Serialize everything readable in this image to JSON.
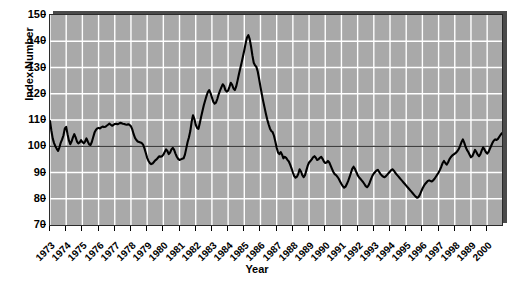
{
  "chart_data": {
    "type": "line",
    "title": "",
    "xlabel": "Year",
    "ylabel": "Index Number",
    "ylim": [
      70,
      150
    ],
    "yticks": [
      70,
      80,
      90,
      100,
      110,
      120,
      130,
      140,
      150
    ],
    "xlim": [
      1973,
      2000.92
    ],
    "grid": true,
    "legend": "none",
    "reference_line": {
      "value": 100,
      "color": "#000000",
      "label": ""
    },
    "xtick_labels": [
      "1973",
      "1974",
      "1975",
      "1976",
      "1977",
      "1978",
      "1979",
      "1980",
      "1981",
      "1982",
      "1983",
      "1984",
      "1985",
      "1986",
      "1987",
      "1988",
      "1989",
      "1990",
      "1991",
      "1992",
      "1993",
      "1994",
      "1995",
      "1996",
      "1997",
      "1998",
      "1989",
      "2000"
    ],
    "series": [
      {
        "name": "Index Number",
        "color": "#000000",
        "x_start": 1973,
        "x_step_months": 1,
        "values": [
          109.6,
          106.0,
          103.0,
          101.2,
          100.0,
          99.0,
          98.2,
          99.6,
          101.4,
          102.6,
          104.2,
          106.8,
          107.4,
          104.6,
          102.2,
          100.8,
          101.8,
          103.4,
          104.6,
          103.4,
          101.8,
          101.1,
          101.5,
          102.3,
          101.6,
          101.1,
          101.8,
          103.0,
          101.8,
          100.7,
          100.5,
          101.6,
          103.4,
          105.2,
          106.2,
          106.8,
          107.0,
          106.8,
          107.2,
          107.5,
          107.3,
          107.4,
          107.8,
          108.2,
          108.6,
          108.2,
          107.8,
          108.1,
          108.5,
          108.6,
          108.4,
          108.6,
          108.9,
          108.8,
          108.6,
          108.5,
          108.3,
          108.2,
          108.4,
          108.1,
          107.6,
          106.4,
          104.6,
          103.2,
          102.4,
          101.8,
          101.6,
          101.4,
          101.2,
          100.6,
          99.2,
          97.4,
          95.6,
          94.4,
          93.6,
          93.2,
          93.4,
          94.0,
          94.6,
          95.0,
          95.6,
          96.2,
          96.0,
          96.2,
          96.8,
          97.8,
          98.8,
          98.2,
          97.0,
          97.6,
          98.8,
          99.4,
          98.6,
          97.2,
          96.0,
          95.2,
          94.8,
          95.0,
          95.2,
          95.4,
          96.8,
          99.2,
          101.6,
          103.4,
          105.8,
          109.4,
          111.8,
          110.4,
          108.2,
          107.0,
          106.6,
          108.8,
          111.2,
          113.4,
          115.6,
          117.4,
          119.2,
          120.6,
          121.4,
          120.2,
          118.6,
          117.0,
          116.2,
          116.6,
          118.0,
          119.8,
          121.2,
          122.4,
          123.6,
          123.0,
          121.4,
          120.8,
          121.2,
          122.6,
          124.2,
          123.4,
          122.0,
          121.4,
          122.8,
          125.0,
          127.4,
          129.6,
          131.8,
          134.2,
          136.6,
          139.2,
          141.4,
          142.3,
          140.8,
          138.0,
          134.6,
          131.8,
          130.8,
          130.2,
          128.4,
          125.6,
          122.6,
          119.8,
          117.2,
          114.8,
          112.4,
          110.2,
          108.4,
          106.8,
          105.8,
          105.4,
          104.0,
          101.8,
          99.4,
          97.6,
          97.0,
          97.8,
          96.8,
          95.4,
          96.0,
          95.6,
          94.8,
          94.2,
          93.0,
          91.6,
          90.0,
          88.6,
          88.0,
          88.4,
          89.4,
          91.2,
          90.4,
          89.0,
          88.2,
          89.0,
          90.8,
          92.6,
          93.8,
          94.4,
          95.0,
          95.8,
          96.2,
          95.6,
          94.8,
          95.0,
          95.6,
          96.0,
          95.2,
          94.2,
          93.6,
          93.8,
          94.4,
          93.8,
          92.6,
          91.4,
          90.2,
          89.4,
          89.0,
          88.4,
          87.6,
          86.6,
          85.6,
          84.8,
          84.2,
          84.6,
          85.6,
          86.8,
          88.2,
          89.8,
          91.4,
          92.2,
          91.4,
          90.2,
          89.0,
          88.2,
          87.6,
          87.0,
          86.4,
          85.6,
          84.8,
          84.4,
          85.0,
          86.2,
          87.6,
          88.8,
          89.6,
          90.2,
          90.8,
          91.0,
          90.2,
          89.4,
          88.8,
          88.4,
          88.2,
          88.6,
          89.2,
          89.8,
          90.4,
          91.0,
          91.2,
          90.6,
          89.8,
          89.2,
          88.6,
          88.0,
          87.4,
          86.8,
          86.2,
          85.6,
          85.0,
          84.4,
          83.8,
          83.2,
          82.6,
          82.0,
          81.4,
          80.8,
          80.4,
          80.6,
          81.4,
          82.6,
          83.8,
          84.8,
          85.6,
          86.2,
          86.8,
          87.0,
          86.8,
          86.6,
          87.0,
          87.6,
          88.4,
          89.2,
          90.0,
          91.0,
          92.2,
          93.6,
          94.4,
          93.6,
          93.0,
          93.8,
          95.0,
          95.8,
          96.4,
          96.8,
          97.2,
          97.6,
          98.2,
          99.0,
          100.2,
          101.6,
          102.6,
          101.4,
          99.8,
          98.6,
          97.8,
          96.8,
          95.8,
          96.2,
          97.4,
          98.6,
          97.8,
          96.8,
          96.2,
          97.0,
          98.4,
          99.6,
          98.8,
          97.8,
          97.2,
          97.8,
          99.0,
          100.2,
          101.4,
          102.2,
          102.6,
          102.4,
          102.8,
          103.6,
          104.4,
          105.0
        ]
      }
    ]
  }
}
